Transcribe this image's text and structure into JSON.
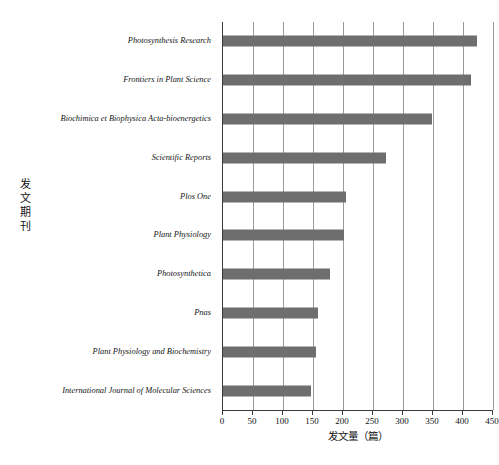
{
  "chart_data": {
    "type": "bar",
    "orientation": "horizontal",
    "title": "",
    "xlabel": "发文量（篇）",
    "ylabel": "发文期刊",
    "xlim": [
      0,
      450
    ],
    "xticks": [
      0,
      50,
      100,
      150,
      200,
      250,
      300,
      350,
      400,
      450
    ],
    "grid": "vertical",
    "legend": "none",
    "bar_color": "#6e6e6e",
    "axis_color": "#3a3a3a",
    "grid_color": "#9a9a9a",
    "categories": [
      "Photosynthesis Research",
      "Frontiers in Plant Science",
      "Biochimica et Biophysica Acta-bioenergetics",
      "Scientific Reports",
      "Plos One",
      "Plant Physiology",
      "Photosynthetica",
      "Pnas",
      "Plant Physiology and Biochemistry",
      "International Journal of Molecular Sciences"
    ],
    "values": [
      423,
      413,
      348,
      272,
      205,
      202,
      178,
      158,
      155,
      146
    ]
  },
  "caption": {
    "text": ""
  }
}
